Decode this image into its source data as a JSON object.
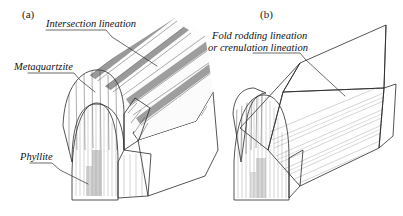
{
  "figure": {
    "background_color": "#ffffff"
  },
  "panels": [
    {
      "id": "a",
      "letter": "(a)",
      "callouts": [
        {
          "name": "intersection-lineation",
          "lines": [
            "Intersection lineation"
          ]
        },
        {
          "name": "metaquartzite",
          "lines": [
            "Metaquartzite"
          ]
        },
        {
          "name": "phyllite",
          "lines": [
            "Phyllite"
          ]
        }
      ]
    },
    {
      "id": "b",
      "letter": "(b)",
      "callouts": [
        {
          "name": "fold-rodding-lineation",
          "lines": [
            "Fold rodding lineation",
            "or crenulation lineation"
          ]
        }
      ]
    }
  ],
  "labels": {
    "a_letter": "(a)",
    "b_letter": "(b)",
    "intersection_lineation": "Intersection lineation",
    "metaquartzite": "Metaquartzite",
    "phyllite": "Phyllite",
    "fold_rodding_line1": "Fold rodding lineation",
    "fold_rodding_line2": "or crenulation lineation"
  },
  "colors": {
    "ink": "#2a2a2a",
    "text": "#111111",
    "metaquartzite_dark": "#8d8d8d",
    "metaquartzite_mid": "#9b9b9b",
    "phyllite_light": "#d8d8d8",
    "rib_white": "#fdfdfd",
    "rib_gray": "#9a9a9a",
    "face_pale": "#ededed",
    "fin_gradient_from": "#6e6e6e",
    "fin_gradient_to": "#dcdcdc",
    "panel_b_surface": "#d2d2d2"
  }
}
